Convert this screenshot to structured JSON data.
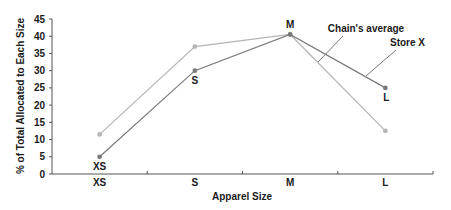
{
  "chart_data": {
    "type": "line",
    "title": "",
    "xlabel": "Apparel Size",
    "ylabel": "% of Total Allocated to Each Size",
    "categories": [
      "XS",
      "S",
      "M",
      "L"
    ],
    "ylim": [
      0,
      45
    ],
    "yticks": [
      0,
      5,
      10,
      15,
      20,
      25,
      30,
      35,
      40,
      45
    ],
    "grid": false,
    "legend": "callout annotations",
    "series": [
      {
        "name": "Chain's average",
        "values": [
          11.5,
          37,
          40.5,
          12.5
        ],
        "color": "#b5b5b5",
        "point_labels": [
          "",
          "",
          "",
          ""
        ]
      },
      {
        "name": "Store X",
        "values": [
          5,
          30,
          40.5,
          25
        ],
        "color": "#7a7a7a",
        "point_labels": [
          "XS",
          "S",
          "M",
          "L"
        ]
      }
    ]
  }
}
